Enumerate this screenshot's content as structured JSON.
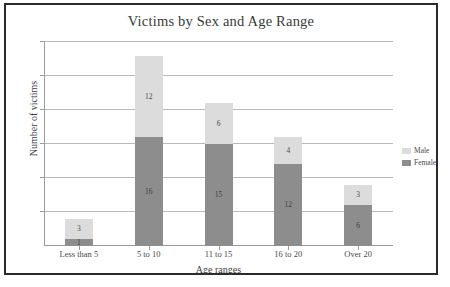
{
  "chart_data": {
    "type": "bar",
    "subtype": "stacked-bar",
    "title": "Victims by Sex and Age Range",
    "xlabel": "Age ranges",
    "ylabel": "Number of victims",
    "categories": [
      "Less than 5",
      "5 to 10",
      "11 to 15",
      "16 to 20",
      "Over 20"
    ],
    "series": [
      {
        "name": "Female",
        "values": [
          1,
          16,
          15,
          12,
          6
        ],
        "color": "#8d8d8d"
      },
      {
        "name": "Male",
        "values": [
          3,
          12,
          6,
          4,
          3
        ],
        "color": "#dcdcdc"
      }
    ],
    "stack_order_bottom_to_top": [
      "Female",
      "Male"
    ],
    "totals": [
      4,
      28,
      21,
      16,
      9
    ],
    "ylim": [
      0,
      30
    ],
    "y_tick_interval": 5,
    "y_tick_labels_shown": false,
    "gridlines": true,
    "gridline_values": [
      5,
      10,
      15,
      20,
      25,
      30
    ],
    "legend_position": "right",
    "legend_entries": [
      "Male",
      "Female"
    ]
  },
  "legend": {
    "items": [
      {
        "label": "Male",
        "swatch": "male"
      },
      {
        "label": "Female",
        "swatch": "female"
      }
    ]
  }
}
